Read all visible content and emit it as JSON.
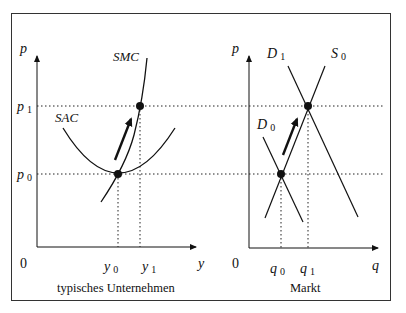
{
  "figure": {
    "left_panel": {
      "caption": "typisches Unternehmen",
      "y_axis_label": "p",
      "x_axis_label": "y",
      "origin_label": "0",
      "price_ticks": [
        {
          "name": "p",
          "sub": "1"
        },
        {
          "name": "p",
          "sub": "0"
        }
      ],
      "quantity_ticks": [
        {
          "name": "y",
          "sub": "0"
        },
        {
          "name": "y",
          "sub": "1"
        }
      ],
      "curves": [
        "SMC",
        "SAC"
      ],
      "points": [
        {
          "label": "(y1,p1)",
          "desc": "SMC at p1"
        },
        {
          "label": "(y0,p0)",
          "desc": "SAC minimum = SMC"
        }
      ],
      "arrow": "movement up along SMC"
    },
    "right_panel": {
      "caption": "Markt",
      "y_axis_label": "p",
      "x_axis_label": "q",
      "origin_label": "0",
      "quantity_ticks": [
        {
          "name": "q",
          "sub": "0"
        },
        {
          "name": "q",
          "sub": "1"
        }
      ],
      "curves": [
        {
          "name": "D",
          "sub": "1"
        },
        {
          "name": "S",
          "sub": "0"
        },
        {
          "name": "D",
          "sub": "0"
        }
      ],
      "points": [
        {
          "label": "(q1,p1)",
          "desc": "D1 ∩ S0"
        },
        {
          "label": "(q0,p0)",
          "desc": "D0 ∩ S0"
        }
      ],
      "arrow": "demand shift D0 → D1"
    },
    "colors": {
      "line": "#111111",
      "frame": "#333333",
      "background": "#ffffff"
    }
  }
}
